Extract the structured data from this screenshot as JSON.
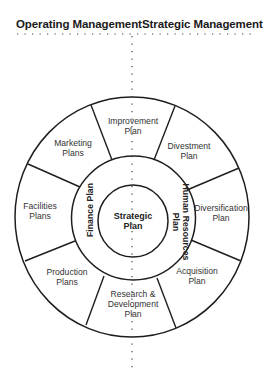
{
  "header": {
    "left_title": "Operating Management",
    "right_title": "Strategic Management"
  },
  "center": {
    "label_line1": "Strategic",
    "label_line2": "Plan"
  },
  "middle_ring": {
    "left_label": "Finance Plan",
    "right_label_line1": "Human Resources",
    "right_label_line2": "Plan"
  },
  "outer_ring": {
    "segments": [
      {
        "line1": "Improvement",
        "line2": "Plan",
        "side": "strategic"
      },
      {
        "line1": "Divestment",
        "line2": "Plan",
        "side": "strategic"
      },
      {
        "line1": "Diversification",
        "line2": "Plan",
        "side": "strategic"
      },
      {
        "line1": "Acquisition",
        "line2": "Plan",
        "side": "strategic"
      },
      {
        "line1": "Research &",
        "line2": "Development",
        "line3": "Plan",
        "side": "both"
      },
      {
        "line1": "Production",
        "line2": "Plans",
        "side": "operating"
      },
      {
        "line1": "Facilities",
        "line2": "Plans",
        "side": "operating"
      },
      {
        "line1": "Marketing",
        "line2": "Plans",
        "side": "operating"
      }
    ]
  },
  "colors": {
    "stroke": "#1e1e1e",
    "text": "#333333",
    "background": "#ffffff"
  }
}
